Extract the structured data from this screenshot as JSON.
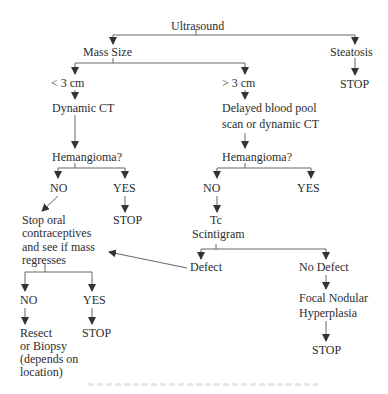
{
  "diagram": {
    "type": "flowchart",
    "nodes": {
      "ultrasound": "Ultrasound",
      "mass_size": "Mass Size",
      "steatosis": "Steatosis",
      "steatosis_stop": "STOP",
      "lt3": "< 3 cm",
      "gt3": "> 3 cm",
      "dynamic_ct": "Dynamic CT",
      "delayed_1": "Delayed blood pool",
      "delayed_2": "scan or dynamic CT",
      "hemangioma_left": "Hemangioma?",
      "hemangioma_right": "Hemangioma?",
      "left_no": "NO",
      "left_yes": "YES",
      "left_yes_stop": "STOP",
      "right_no": "NO",
      "right_yes": "YES",
      "stop_oral_1": "Stop oral",
      "stop_oral_2": "contraceptives",
      "stop_oral_3": "and see if mass",
      "stop_oral_4": "regresses",
      "tc_1": "Tc",
      "tc_2": "Scintigram",
      "defect": "Defect",
      "no_defect": "No Defect",
      "regress_no": "NO",
      "regress_yes": "YES",
      "resect_1": "Resect",
      "resect_2": "or Biopsy",
      "resect_3": "(depends on",
      "resect_4": "location)",
      "regress_yes_stop": "STOP",
      "fnh_1": "Focal Nodular",
      "fnh_2": "Hyperplasia",
      "fnh_stop": "STOP"
    },
    "edges": [
      [
        "Ultrasound",
        "Mass Size"
      ],
      [
        "Ultrasound",
        "Steatosis"
      ],
      [
        "Steatosis",
        "STOP"
      ],
      [
        "Mass Size",
        "< 3 cm"
      ],
      [
        "Mass Size",
        "> 3 cm"
      ],
      [
        "< 3 cm",
        "Dynamic CT"
      ],
      [
        "Dynamic CT",
        "Hemangioma?"
      ],
      [
        "Hemangioma?",
        "NO"
      ],
      [
        "Hemangioma?",
        "YES"
      ],
      [
        "YES",
        "STOP"
      ],
      [
        "NO",
        "Stop oral contraceptives and see if mass regresses"
      ],
      [
        "> 3 cm",
        "Delayed blood pool scan or dynamic CT"
      ],
      [
        "Delayed blood pool scan or dynamic CT",
        "Hemangioma?"
      ],
      [
        "Hemangioma?",
        "NO"
      ],
      [
        "Hemangioma?",
        "YES"
      ],
      [
        "NO",
        "Tc Scintigram"
      ],
      [
        "Tc Scintigram",
        "Defect"
      ],
      [
        "Tc Scintigram",
        "No Defect"
      ],
      [
        "Defect",
        "Stop oral contraceptives and see if mass regresses"
      ],
      [
        "No Defect",
        "Focal Nodular Hyperplasia"
      ],
      [
        "Focal Nodular Hyperplasia",
        "STOP"
      ],
      [
        "Stop oral contraceptives and see if mass regresses",
        "NO"
      ],
      [
        "Stop oral contraceptives and see if mass regresses",
        "YES"
      ],
      [
        "NO",
        "Resect or Biopsy (depends on location)"
      ],
      [
        "YES",
        "STOP"
      ]
    ],
    "line_color": "#555555",
    "text_color": "#2d2d2d"
  }
}
